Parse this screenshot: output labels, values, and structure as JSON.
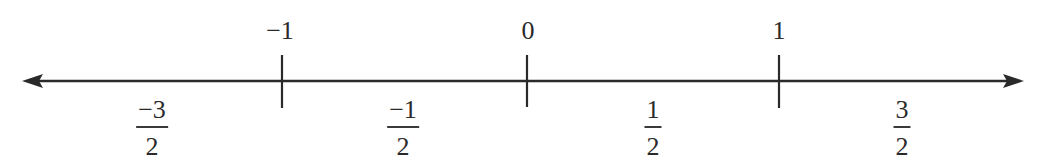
{
  "diagram": {
    "type": "number-line",
    "axis": {
      "y": 81,
      "x_start": 22,
      "x_end": 1024,
      "color": "#2a2a2a",
      "arrows": "both"
    },
    "ticks": [
      {
        "value": -1,
        "label": "−1",
        "x": 282
      },
      {
        "value": 0,
        "label": "0",
        "x": 527
      },
      {
        "value": 1,
        "label": "1",
        "x": 779
      }
    ],
    "fractions": [
      {
        "value": -1.5,
        "numerator": "−3",
        "denominator": "2",
        "x": 152
      },
      {
        "value": -0.5,
        "numerator": "−1",
        "denominator": "2",
        "x": 403
      },
      {
        "value": 0.5,
        "numerator": "1",
        "denominator": "2",
        "x": 653
      },
      {
        "value": 1.5,
        "numerator": "3",
        "denominator": "2",
        "x": 902
      }
    ]
  }
}
